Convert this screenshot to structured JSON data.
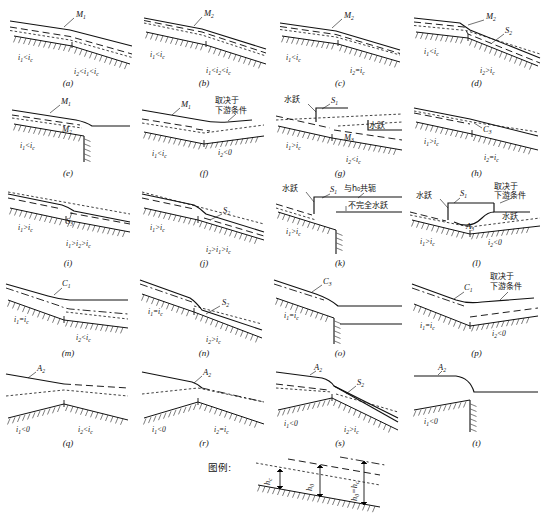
{
  "figure": {
    "kind": "hydraulics-water-surface-profiles",
    "legend_title": "图例:",
    "legend_items": [
      {
        "symbol": "h",
        "subscript": "c",
        "style": "dotted",
        "name": "critical-depth-line"
      },
      {
        "symbol": "h",
        "subscript": "0",
        "style": "dashed",
        "name": "normal-depth-line"
      },
      {
        "symbol": "h",
        "subscript": "0 = h c",
        "style": "dash-dot",
        "name": "normal-equals-critical-line"
      }
    ],
    "legend_labels": [
      "h_c",
      "h_0",
      "h_0 = h_c"
    ]
  },
  "symbols": {
    "i1": "i",
    "i1_sub": "1",
    "i2": "i",
    "i2_sub": "2",
    "ic_sub": "c",
    "h0_sub": "0",
    "hc_sub": "c"
  },
  "panels": [
    {
      "id": "a",
      "caption": "(a)",
      "row": 0,
      "col": 0,
      "curves": [
        {
          "label": "M",
          "sub": "1"
        }
      ],
      "left_cond": {
        "base": "i",
        "bsub": "1",
        "op": "<",
        "rel": "i",
        "rsub": "c"
      },
      "right_cond_text": "i₂<i₁<i_c",
      "right_cond_parts": [
        {
          "base": "i",
          "bsub": "2"
        },
        {
          "op": "<"
        },
        {
          "base": "i",
          "bsub": "1"
        },
        {
          "op": "<"
        },
        {
          "base": "i",
          "bsub": "c"
        }
      ]
    },
    {
      "id": "b",
      "caption": "(b)",
      "row": 0,
      "col": 1,
      "curves": [
        {
          "label": "M",
          "sub": "2"
        }
      ],
      "left_cond": {
        "base": "i",
        "bsub": "1",
        "op": "<",
        "rel": "i",
        "rsub": "c"
      },
      "right_cond_parts": [
        {
          "base": "i",
          "bsub": "1"
        },
        {
          "op": "<"
        },
        {
          "base": "i",
          "bsub": "2"
        },
        {
          "op": "<"
        },
        {
          "base": "i",
          "bsub": "c"
        }
      ]
    },
    {
      "id": "c",
      "caption": "(c)",
      "row": 0,
      "col": 2,
      "curves": [
        {
          "label": "M",
          "sub": "2"
        }
      ],
      "left_cond": {
        "base": "i",
        "bsub": "1",
        "op": "<",
        "rel": "i",
        "rsub": "c"
      },
      "right_cond_parts": [
        {
          "base": "i",
          "bsub": "2"
        },
        {
          "op": "="
        },
        {
          "base": "i",
          "bsub": "c"
        }
      ]
    },
    {
      "id": "d",
      "caption": "(d)",
      "row": 0,
      "col": 3,
      "curves": [
        {
          "label": "M",
          "sub": "2"
        },
        {
          "label": "S",
          "sub": "2"
        }
      ],
      "left_cond": {
        "base": "i",
        "bsub": "1",
        "op": "<",
        "rel": "i",
        "rsub": "c"
      },
      "right_cond_parts": [
        {
          "base": "i",
          "bsub": "2"
        },
        {
          "op": ">"
        },
        {
          "base": "i",
          "bsub": "c"
        }
      ]
    },
    {
      "id": "e",
      "caption": "(e)",
      "row": 1,
      "col": 0,
      "curves": [
        {
          "label": "M",
          "sub": "1"
        },
        {
          "label": "M",
          "sub": "2"
        }
      ],
      "left_cond": {
        "base": "i",
        "bsub": "1",
        "op": "<",
        "rel": "i",
        "rsub": "c"
      },
      "right_cond_parts": [],
      "feature": "free-overfall"
    },
    {
      "id": "f",
      "caption": "(f)",
      "row": 1,
      "col": 1,
      "curves": [
        {
          "label": "M",
          "sub": "1"
        }
      ],
      "note_cn": [
        "取决于",
        "下游条件"
      ],
      "left_cond": {
        "base": "i",
        "bsub": "1",
        "op": "<",
        "rel": "i",
        "rsub": "c"
      },
      "right_cond_parts": [
        {
          "base": "i",
          "bsub": "2"
        },
        {
          "op": "<"
        },
        {
          "base": "0"
        }
      ]
    },
    {
      "id": "g",
      "caption": "(g)",
      "row": 1,
      "col": 2,
      "curves": [
        {
          "label": "S",
          "sub": "1"
        },
        {
          "label": "M",
          "sub": "3"
        }
      ],
      "jump_labels": [
        "水跃",
        "水跃"
      ],
      "left_cond": {
        "base": "i",
        "bsub": "1",
        "op": ">",
        "rel": "i",
        "rsub": "c"
      },
      "right_cond_parts": [
        {
          "base": "i",
          "bsub": "2"
        },
        {
          "op": "<"
        },
        {
          "base": "i",
          "bsub": "c"
        }
      ]
    },
    {
      "id": "h",
      "caption": "(h)",
      "row": 1,
      "col": 3,
      "curves": [
        {
          "label": "C",
          "sub": "3"
        }
      ],
      "left_cond": {
        "base": "i",
        "bsub": "1",
        "op": ">",
        "rel": "i",
        "rsub": "c"
      },
      "right_cond_parts": [
        {
          "base": "i",
          "bsub": "2"
        },
        {
          "op": "="
        },
        {
          "base": "i",
          "bsub": "c"
        }
      ]
    },
    {
      "id": "i",
      "caption": "(i)",
      "row": 2,
      "col": 0,
      "curves": [
        {
          "label": "S",
          "sub": "3"
        }
      ],
      "left_cond": {
        "base": "i",
        "bsub": "1",
        "op": ">",
        "rel": "i",
        "rsub": "c"
      },
      "right_cond_parts": [
        {
          "base": "i",
          "bsub": "1"
        },
        {
          "op": ">"
        },
        {
          "base": "i",
          "bsub": "2"
        },
        {
          "op": ">"
        },
        {
          "base": "i",
          "bsub": "c"
        }
      ]
    },
    {
      "id": "j",
      "caption": "(j)",
      "row": 2,
      "col": 1,
      "curves": [
        {
          "label": "S",
          "sub": "2"
        }
      ],
      "left_cond": {
        "base": "i",
        "bsub": "1",
        "op": ">",
        "rel": "i",
        "rsub": "c"
      },
      "right_cond_parts": [
        {
          "base": "i",
          "bsub": "2"
        },
        {
          "op": ">"
        },
        {
          "base": "i",
          "bsub": "1"
        },
        {
          "op": ">"
        },
        {
          "base": "i",
          "bsub": "c"
        }
      ]
    },
    {
      "id": "k",
      "caption": "(k)",
      "row": 2,
      "col": 2,
      "curves": [
        {
          "label": "S",
          "sub": "1"
        }
      ],
      "jump_labels": [
        "水跃"
      ],
      "note_cn": [
        "与h₀共轭",
        "不完全水跃"
      ],
      "left_cond": {
        "base": "i",
        "bsub": "1",
        "op": ">",
        "rel": "i",
        "rsub": "c"
      },
      "right_cond_parts": [],
      "feature": "free-overfall"
    },
    {
      "id": "l",
      "caption": "(l)",
      "row": 2,
      "col": 3,
      "curves": [
        {
          "label": "S",
          "sub": "1"
        },
        {
          "label": "A",
          "sub": "3"
        }
      ],
      "jump_labels": [
        "水跃",
        "水跃"
      ],
      "note_cn": [
        "取决于",
        "下游条件"
      ],
      "left_cond": {
        "base": "i",
        "bsub": "1",
        "op": ">",
        "rel": "i",
        "rsub": "c"
      },
      "right_cond_parts": [
        {
          "base": "i",
          "bsub": "2"
        },
        {
          "op": "<"
        },
        {
          "base": "0"
        }
      ]
    },
    {
      "id": "m",
      "caption": "(m)",
      "row": 3,
      "col": 0,
      "curves": [
        {
          "label": "C",
          "sub": "1"
        }
      ],
      "left_cond": {
        "base": "i",
        "bsub": "1",
        "op": "=",
        "rel": "i",
        "rsub": "c"
      },
      "right_cond_parts": [
        {
          "base": "i",
          "bsub": "2"
        },
        {
          "op": "<"
        },
        {
          "base": "i",
          "bsub": "c"
        }
      ]
    },
    {
      "id": "n",
      "caption": "(n)",
      "row": 3,
      "col": 1,
      "curves": [
        {
          "label": "S",
          "sub": "2"
        }
      ],
      "left_cond": {
        "base": "i",
        "bsub": "1",
        "op": "=",
        "rel": "i",
        "rsub": "c"
      },
      "right_cond_parts": [
        {
          "base": "i",
          "bsub": "2"
        },
        {
          "op": ">"
        },
        {
          "base": "i",
          "bsub": "c"
        }
      ]
    },
    {
      "id": "o",
      "caption": "(o)",
      "row": 3,
      "col": 2,
      "curves": [
        {
          "label": "C",
          "sub": "3"
        }
      ],
      "left_cond": {
        "base": "i",
        "bsub": "1",
        "op": "=",
        "rel": "i",
        "rsub": "c"
      },
      "right_cond_parts": [],
      "feature": "free-overfall"
    },
    {
      "id": "p",
      "caption": "(p)",
      "row": 3,
      "col": 3,
      "curves": [
        {
          "label": "C",
          "sub": "1"
        }
      ],
      "note_cn": [
        "取决于",
        "下游条件"
      ],
      "left_cond": {
        "base": "i",
        "bsub": "1",
        "op": "=",
        "rel": "i",
        "rsub": "c"
      },
      "right_cond_parts": [
        {
          "base": "i",
          "bsub": "2"
        },
        {
          "op": "<"
        },
        {
          "base": "0"
        }
      ]
    },
    {
      "id": "q",
      "caption": "(q)",
      "row": 4,
      "col": 0,
      "curves": [
        {
          "label": "A",
          "sub": "2"
        }
      ],
      "left_cond": {
        "base": "i",
        "bsub": "1",
        "op": "<",
        "rel": "0",
        "rsub": ""
      },
      "right_cond_parts": [
        {
          "base": "i",
          "bsub": "2"
        },
        {
          "op": "<"
        },
        {
          "base": "i",
          "bsub": "c"
        }
      ]
    },
    {
      "id": "r",
      "caption": "(r)",
      "row": 4,
      "col": 1,
      "curves": [
        {
          "label": "A",
          "sub": "2"
        }
      ],
      "left_cond": {
        "base": "i",
        "bsub": "1",
        "op": "<",
        "rel": "0",
        "rsub": ""
      },
      "right_cond_parts": [
        {
          "base": "i",
          "bsub": "2"
        },
        {
          "op": "="
        },
        {
          "base": "i",
          "bsub": "c"
        }
      ]
    },
    {
      "id": "s",
      "caption": "(s)",
      "row": 4,
      "col": 2,
      "curves": [
        {
          "label": "A",
          "sub": "2"
        },
        {
          "label": "S",
          "sub": "2"
        }
      ],
      "left_cond": {
        "base": "i",
        "bsub": "1",
        "op": "<",
        "rel": "0",
        "rsub": ""
      },
      "right_cond_parts": [
        {
          "base": "i",
          "bsub": "2"
        },
        {
          "op": ">"
        },
        {
          "base": "i",
          "bsub": "c"
        }
      ]
    },
    {
      "id": "t",
      "caption": "(t)",
      "row": 4,
      "col": 3,
      "curves": [
        {
          "label": "A",
          "sub": "2"
        }
      ],
      "left_cond": {
        "base": "i",
        "bsub": "1",
        "op": "<",
        "rel": "0",
        "rsub": ""
      },
      "right_cond_parts": [],
      "feature": "free-overfall"
    }
  ]
}
